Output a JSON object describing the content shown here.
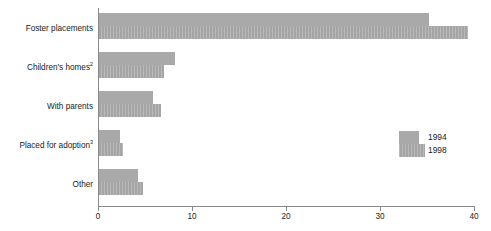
{
  "chart_data": {
    "type": "bar",
    "orientation": "horizontal",
    "title": "",
    "subtitle": "",
    "xlabel": "",
    "ylabel": "",
    "categories": [
      "Foster placements",
      "Children's homes",
      "With parents",
      "Placed for adoption",
      "Other"
    ],
    "category_footnotes": [
      "",
      "2",
      "",
      "3",
      ""
    ],
    "series": [
      {
        "name": "1994",
        "values": [
          35.2,
          8.2,
          5.8,
          2.3,
          4.3
        ],
        "color": "#a9a9a9"
      },
      {
        "name": "1998",
        "values": [
          39.4,
          7.0,
          6.7,
          2.7,
          4.8
        ],
        "color": "#a5a5a5"
      }
    ],
    "xlim": [
      0,
      40
    ],
    "xticks": [
      0,
      10,
      20,
      30,
      40
    ],
    "xtick_labels": [
      "0",
      "10",
      "20",
      "30",
      "40"
    ],
    "grid": false,
    "legend_position": "center-right"
  },
  "legend": {
    "entries": [
      {
        "label": "1994"
      },
      {
        "label": "1998"
      }
    ]
  }
}
